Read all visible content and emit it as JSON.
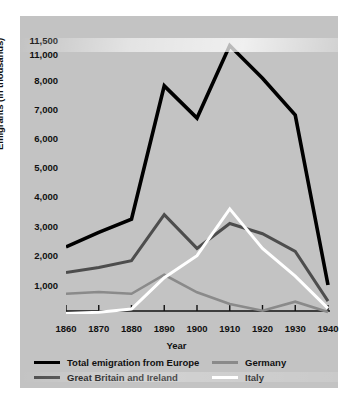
{
  "chart_data": {
    "type": "line",
    "title": "",
    "xlabel": "Year",
    "ylabel": "Emigrants (in thousands)",
    "x": [
      1860,
      1870,
      1880,
      1890,
      1900,
      1910,
      1920,
      1930,
      1940
    ],
    "xtick_labels": [
      "1860",
      "1870",
      "1880",
      "1890",
      "1900",
      "1910",
      "1920",
      "1930",
      "1940"
    ],
    "ytick_labels": [
      "11,500",
      "11,000",
      "8,000",
      "7,000",
      "6,000",
      "5,000",
      "4,000",
      "3,000",
      "2,000",
      "1,000"
    ],
    "ytick_values": [
      11500,
      11000,
      8000,
      7000,
      6000,
      5000,
      4000,
      3000,
      2000,
      1000
    ],
    "axis_break": {
      "between": [
        11000,
        8000
      ],
      "symbol": "zigzag"
    },
    "ylim": [
      0,
      11500
    ],
    "grid": false,
    "legend_position": "below",
    "series": [
      {
        "name": "Total emigration from Europe",
        "color": "#000000",
        "values": [
          2300,
          2800,
          3250,
          7800,
          6700,
          11300,
          8200,
          6800,
          1000
        ]
      },
      {
        "name": "Great Britain and Ireland",
        "color": "#4d4d4d",
        "values": [
          1430,
          1600,
          1830,
          3400,
          2250,
          3100,
          2750,
          2150,
          450
        ]
      },
      {
        "name": "Germany",
        "color": "#8a8a8a",
        "values": [
          700,
          760,
          700,
          1350,
          750,
          350,
          120,
          430,
          80
        ]
      },
      {
        "name": "Italy",
        "color": "#ffffff",
        "values": [
          30,
          70,
          180,
          1250,
          2000,
          3600,
          2250,
          1300,
          200
        ]
      }
    ]
  },
  "axis": {
    "ylabel": "Emigrants (in thousands)",
    "xlabel": "Year"
  },
  "legend": {
    "items": [
      {
        "label": "Total emigration from Europe",
        "swatch": "sw-black"
      },
      {
        "label": "Germany",
        "swatch": "sw-de"
      },
      {
        "label": "Great Britain and Ireland",
        "swatch": "sw-gb"
      },
      {
        "label": "Italy",
        "swatch": "sw-it"
      }
    ]
  }
}
